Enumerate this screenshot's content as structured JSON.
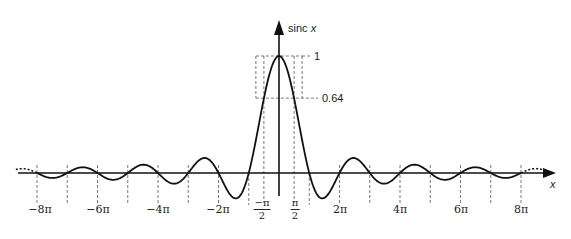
{
  "chart_data": {
    "type": "line",
    "title": "",
    "function": "sinc x = sin(x)/x",
    "xlabel": "x",
    "ylabel": "sinc x",
    "xlim": [
      -8.7,
      9.2
    ],
    "ylim": [
      -0.22,
      1.3
    ],
    "grid": false,
    "legend": null,
    "x_tick_labels": [
      "−8π",
      "−6π",
      "−4π",
      "−2π",
      "−π/2",
      "π/2",
      "2π",
      "4π",
      "6π",
      "8π"
    ],
    "x_tick_values": [
      -25.13,
      -18.85,
      -12.57,
      -6.28,
      -1.571,
      1.571,
      6.28,
      12.57,
      18.85,
      25.13
    ],
    "y_annotations": [
      {
        "value": 1,
        "label": "1"
      },
      {
        "value": 0.64,
        "label": "0.64"
      }
    ],
    "zero_crossings": [
      "±π",
      "±2π",
      "±3π",
      "±4π",
      "±5π",
      "±6π",
      "±7π",
      "±8π"
    ],
    "annotations": [
      "dashed box from x=−π/2 to π/2 up to y=1",
      "dashed line at y=0.64 at x=±π/2",
      "dashed vertical guides at each integer multiple of π",
      "dotted continuation of curve beyond ±8π"
    ],
    "series": [
      {
        "name": "sinc x",
        "x_range": [
          -25.13,
          25.13
        ],
        "peak": {
          "x": 0,
          "y": 1
        }
      }
    ]
  },
  "labels": {
    "y_axis": "sinc ",
    "y_axis_var": "x",
    "x_axis": "x",
    "one": "1",
    "point64": "0.64",
    "neg8pi": "−8π",
    "neg6pi": "−6π",
    "neg4pi": "−4π",
    "neg2pi": "−2π",
    "pos2pi": "2π",
    "pos4pi": "4π",
    "pos6pi": "6π",
    "pos8pi": "8π",
    "neg_half_pi_num": "−π",
    "half_pi_num": "π",
    "half_den": "2"
  }
}
